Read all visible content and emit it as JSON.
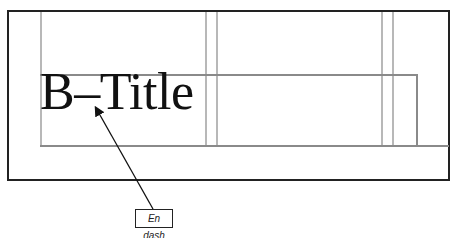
{
  "diagram": {
    "title_text": "B–Title",
    "callout": {
      "label": "En dash",
      "points_to": "en-dash-character"
    },
    "colors": {
      "frame": "#222222",
      "guides_light": "#b8b8b8",
      "guides_dark": "#8a8a8a",
      "text": "#111111"
    }
  }
}
